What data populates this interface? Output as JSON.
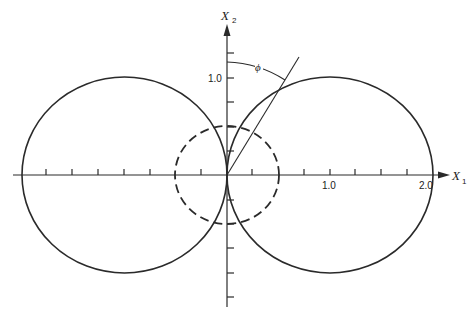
{
  "diagram": {
    "type": "polar-dipole-pattern",
    "colors": {
      "stroke": "#2a2a2a",
      "background": "#ffffff"
    },
    "axes": {
      "x": {
        "label": "X",
        "subscript": "1",
        "tick_labels": [
          {
            "value": 1.0,
            "text": "1.0"
          },
          {
            "value": 2.0,
            "text": "2.0"
          }
        ],
        "tick_spacing": 0.25
      },
      "y": {
        "label": "X",
        "subscript": "2",
        "tick_labels": [
          {
            "value": 1.0,
            "text": "1.0"
          }
        ],
        "tick_spacing": 0.25
      }
    },
    "angle_label": "ϕ",
    "curves": [
      {
        "name": "right-lobe",
        "style": "solid",
        "center": [
          1.0,
          0.0
        ],
        "radius": 1.0
      },
      {
        "name": "left-lobe",
        "style": "solid",
        "center": [
          -1.0,
          0.0
        ],
        "radius": 1.0
      },
      {
        "name": "inner-circle",
        "style": "dashed",
        "center": [
          0.0,
          0.0
        ],
        "radius": 0.5
      }
    ],
    "ray": {
      "from": [
        0,
        0
      ],
      "angle_from_x2_deg": 31
    }
  }
}
